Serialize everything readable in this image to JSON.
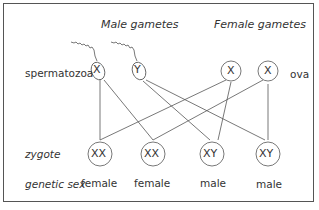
{
  "headers": {
    "male": "Male gametes",
    "female": "Female gametes"
  },
  "row_labels": {
    "sperm": "spermatozoa",
    "ova": "ova",
    "zygote": "zygote",
    "sex": "genetic sex"
  },
  "sperm": [
    {
      "chromosome": "X"
    },
    {
      "chromosome": "Y"
    }
  ],
  "ova": [
    {
      "chromosome": "X"
    },
    {
      "chromosome": "X"
    }
  ],
  "zygotes": [
    {
      "genotype": "XX",
      "sex": "female"
    },
    {
      "genotype": "XX",
      "sex": "female"
    },
    {
      "genotype": "XY",
      "sex": "male"
    },
    {
      "genotype": "XY",
      "sex": "male"
    }
  ],
  "colors": {
    "line": "#555555",
    "text": "#333333",
    "frame": "#555555"
  }
}
